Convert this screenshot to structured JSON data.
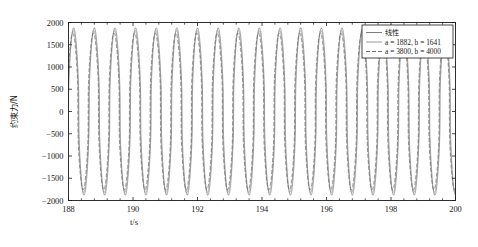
{
  "figure": {
    "background": "#ffffff",
    "axes_color": "#1a1a1a"
  },
  "chart_data": {
    "type": "line",
    "title": "",
    "xlabel": "t/s",
    "ylabel": "约束力/N",
    "xlim": [
      188,
      200
    ],
    "ylim": [
      -2000,
      2000
    ],
    "xticks": [
      188,
      190,
      192,
      194,
      196,
      198,
      200
    ],
    "xtick_labels": [
      "188",
      "190",
      "192",
      "194",
      "196",
      "198",
      "200"
    ],
    "x_minor_tick_count": 4,
    "yticks": [
      -2000,
      -1500,
      -1000,
      -500,
      0,
      500,
      1000,
      1500,
      2000
    ],
    "ytick_labels": [
      "-2000",
      "-1500",
      "-1000",
      "-500",
      "0",
      "500",
      "1000",
      "1500",
      "2000"
    ],
    "grid": false,
    "legend_position": "upper right",
    "period_seconds": 0.64,
    "cycles_visible": 18.75,
    "waveform": "narrow-peak periodic oscillation",
    "series": [
      {
        "name": "线性",
        "color": "#6f6f6f",
        "linewidth": 0.65,
        "dash": "none",
        "amplitude": 1880,
        "peak_value": 1880,
        "trough_value": -1880,
        "phase": 0.0,
        "peak_sharpness": 0.3
      },
      {
        "name": "a = 1882, b = 1641",
        "color": "#8a8a8a",
        "linewidth": 0.6,
        "dash": "none",
        "amplitude": 1820,
        "peak_value": 1820,
        "trough_value": -1830,
        "phase": 0.022,
        "peak_sharpness": 0.26
      },
      {
        "name": "a = 3800, b = 4000",
        "color": "#555555",
        "linewidth": 0.6,
        "dash": "4,2",
        "amplitude": 1760,
        "peak_value": 1760,
        "trough_value": -1790,
        "phase": 0.046,
        "peak_sharpness": 0.22
      }
    ]
  },
  "legend": {
    "border_color": "#1a1a1a",
    "background": "#ffffff",
    "entries": [
      {
        "label": "线性",
        "is_cjk": true
      },
      {
        "label": "a = 1882, b = 1641",
        "is_cjk": false
      },
      {
        "label": "a = 3800, b = 4000",
        "is_cjk": false
      }
    ]
  }
}
